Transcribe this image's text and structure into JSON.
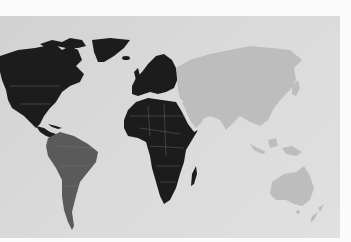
{
  "image": {
    "subject": "world map photograph",
    "colors": {
      "background": "#fbfbfb",
      "ocean": "#d8d8d8",
      "highlighted_land": "#1c1c1c",
      "south_america": "#5a5a5a",
      "other_land": "#bdbdbd",
      "borders": "#8a8a8a"
    },
    "regions": [
      {
        "name": "North America",
        "shade": "highlighted_land"
      },
      {
        "name": "Greenland",
        "shade": "highlighted_land"
      },
      {
        "name": "Europe",
        "shade": "highlighted_land"
      },
      {
        "name": "Africa",
        "shade": "highlighted_land"
      },
      {
        "name": "Madagascar",
        "shade": "highlighted_land"
      },
      {
        "name": "South America",
        "shade": "south_america"
      },
      {
        "name": "Asia",
        "shade": "other_land"
      },
      {
        "name": "Australia",
        "shade": "other_land"
      },
      {
        "name": "New Zealand",
        "shade": "other_land"
      }
    ]
  }
}
